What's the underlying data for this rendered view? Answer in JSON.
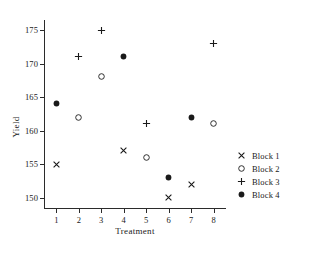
{
  "chart_data": {
    "type": "scatter",
    "title": "",
    "xlabel": "Treatment",
    "ylabel": "Yield",
    "x": [
      1,
      2,
      3,
      4,
      5,
      6,
      7,
      8
    ],
    "xticklabels": [
      "1",
      "2",
      "3",
      "4",
      "5",
      "6",
      "7",
      "8"
    ],
    "yticks": [
      150,
      155,
      160,
      165,
      170,
      175
    ],
    "yticklabels": [
      "150",
      "155",
      "160",
      "165",
      "170",
      "175"
    ],
    "xlim": [
      0.45,
      8.55
    ],
    "ylim": [
      148.3,
      176.5
    ],
    "grid": false,
    "legend_position": "right",
    "series": [
      {
        "name": "Block 1",
        "marker": "cross-x",
        "points": [
          {
            "x": 1,
            "y": 155
          },
          {
            "x": 4,
            "y": 157
          },
          {
            "x": 6,
            "y": 150
          },
          {
            "x": 7,
            "y": 152
          }
        ]
      },
      {
        "name": "Block 2",
        "marker": "open-circle",
        "points": [
          {
            "x": 2,
            "y": 162
          },
          {
            "x": 3,
            "y": 168
          },
          {
            "x": 5,
            "y": 156
          },
          {
            "x": 8,
            "y": 161
          }
        ]
      },
      {
        "name": "Block 3",
        "marker": "plus",
        "points": [
          {
            "x": 2,
            "y": 171
          },
          {
            "x": 3,
            "y": 175
          },
          {
            "x": 5,
            "y": 161
          },
          {
            "x": 8,
            "y": 173
          }
        ]
      },
      {
        "name": "Block 4",
        "marker": "filled-circle",
        "points": [
          {
            "x": 1,
            "y": 164
          },
          {
            "x": 4,
            "y": 171
          },
          {
            "x": 6,
            "y": 153
          },
          {
            "x": 7,
            "y": 162
          }
        ]
      }
    ]
  },
  "colors": {
    "ink": "#1a1a1a",
    "axis": "#2b2b2b",
    "background": "#ffffff"
  }
}
